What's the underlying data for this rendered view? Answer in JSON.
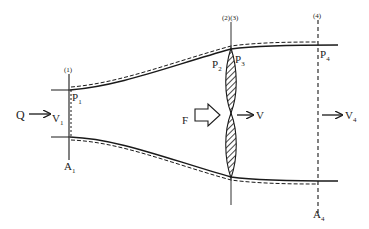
{
  "diagram": {
    "stations": {
      "s1": "(1)",
      "s23": "(2)(3)",
      "s4": "(4)"
    },
    "labels": {
      "Q": "Q",
      "V1": "V",
      "V1_sub": "1",
      "P1": "P",
      "P1_sub": "1",
      "P2": "P",
      "P2_sub": "2",
      "P3": "P",
      "P3_sub": "3",
      "P4": "P",
      "P4_sub": "4",
      "A1": "A",
      "A1_sub": "1",
      "A4": "A",
      "A4_sub": "4",
      "F": "F",
      "V": "V",
      "V4": "V",
      "V4_sub": "4"
    },
    "colors": {
      "line": "#1a1a1a",
      "background": "#ffffff"
    }
  }
}
